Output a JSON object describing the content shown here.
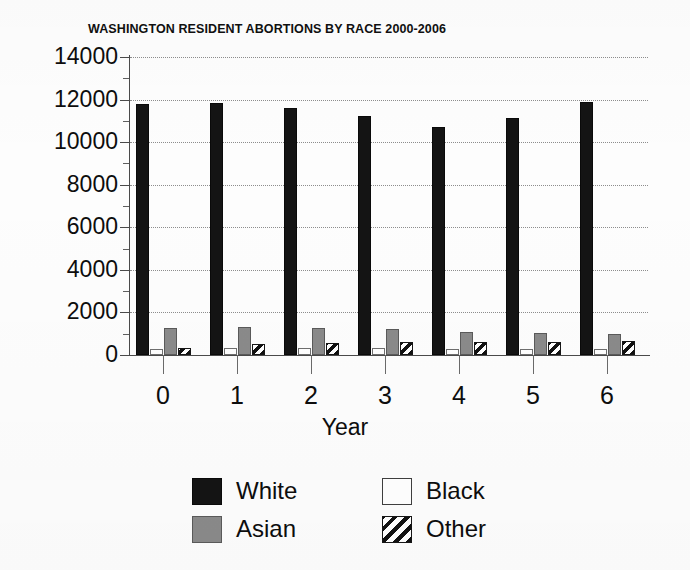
{
  "chart_data": {
    "type": "bar",
    "title": "WASHINGTON RESIDENT ABORTIONS BY RACE 2000-2006",
    "xlabel": "Year",
    "ylabel": "",
    "categories": [
      "0",
      "1",
      "2",
      "3",
      "4",
      "5",
      "6"
    ],
    "ylim": [
      0,
      14000
    ],
    "ytick_labels": [
      "14000",
      "12000",
      "10000",
      "8000",
      "6000",
      "4000",
      "2000",
      "0"
    ],
    "ytick_values": [
      14000,
      12000,
      10000,
      8000,
      6000,
      4000,
      2000,
      0
    ],
    "minor_tick_interval": 1000,
    "grid": "horizontal-dotted",
    "legend_position": "bottom",
    "series": [
      {
        "name": "White",
        "fill": "solid-black",
        "color": "#141414",
        "values": [
          11800,
          11850,
          11600,
          11250,
          10700,
          11150,
          11900
        ]
      },
      {
        "name": "Black",
        "fill": "empty-white",
        "color": "#ffffff",
        "values": [
          300,
          320,
          330,
          310,
          300,
          290,
          300
        ]
      },
      {
        "name": "Asian",
        "fill": "solid-gray",
        "color": "#8a8a8a",
        "values": [
          1250,
          1300,
          1280,
          1230,
          1080,
          1050,
          1000
        ]
      },
      {
        "name": "Other",
        "fill": "diagonal-hatch",
        "color": "#ffffff",
        "values": [
          330,
          520,
          560,
          600,
          600,
          620,
          680
        ]
      }
    ]
  },
  "legend": {
    "entries": [
      {
        "label": "White",
        "swatch": "solid-black-swatch"
      },
      {
        "label": "Black",
        "swatch": "empty-white-swatch"
      },
      {
        "label": "Asian",
        "swatch": "solid-gray-swatch"
      },
      {
        "label": "Other",
        "swatch": "diagonal-hatch-swatch"
      }
    ]
  }
}
